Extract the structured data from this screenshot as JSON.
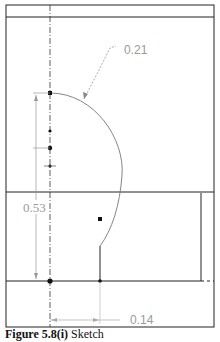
{
  "figure": {
    "caption_label": "Figure 5.8(i)",
    "caption_text": " Sketch"
  },
  "dimensions": {
    "radius": "0.21",
    "height": "0.53",
    "offset": "0.14"
  },
  "colors": {
    "line": "#222222",
    "dim": "#9a9a9a",
    "background": "#ffffff"
  }
}
